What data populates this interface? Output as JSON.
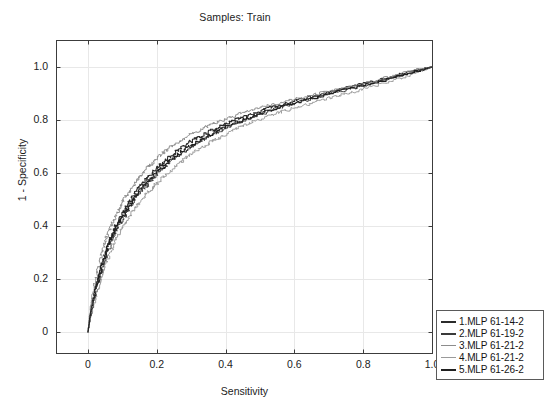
{
  "chart_data": {
    "type": "line",
    "title": "Samples: Train",
    "xlabel": "Sensitivity",
    "ylabel": "1 - Specificity",
    "xlim": [
      -0.04,
      1.04
    ],
    "ylim": [
      -0.04,
      1.04
    ],
    "grid": true,
    "legend_position": "outside-bottom-right",
    "xticks": [
      "0",
      "0.2",
      "0.4",
      "0.6",
      "0.8",
      "1.0"
    ],
    "xtick_values": [
      0,
      0.2,
      0.4,
      0.6,
      0.8,
      1.0
    ],
    "yticks": [
      "0",
      "0.2",
      "0.4",
      "0.6",
      "0.8",
      "1.0"
    ],
    "ytick_values": [
      0,
      0.2,
      0.4,
      0.6,
      0.8,
      1.0
    ],
    "series": [
      {
        "name": "1.MLP 61-14-2",
        "color": "#2b2b2b",
        "x": [
          0,
          0.005,
          0.012,
          0.02,
          0.028,
          0.035,
          0.045,
          0.055,
          0.065,
          0.075,
          0.085,
          0.095,
          0.108,
          0.12,
          0.133,
          0.148,
          0.162,
          0.178,
          0.195,
          0.213,
          0.232,
          0.252,
          0.274,
          0.296,
          0.32,
          0.345,
          0.372,
          0.4,
          0.43,
          0.462,
          0.495,
          0.53,
          0.567,
          0.605,
          0.645,
          0.688,
          0.732,
          0.778,
          0.826,
          0.876,
          0.928,
          0.963,
          1.0
        ],
        "y": [
          0,
          0.055,
          0.108,
          0.152,
          0.196,
          0.232,
          0.278,
          0.318,
          0.352,
          0.385,
          0.412,
          0.438,
          0.468,
          0.492,
          0.518,
          0.544,
          0.565,
          0.588,
          0.612,
          0.634,
          0.655,
          0.676,
          0.698,
          0.716,
          0.734,
          0.752,
          0.77,
          0.786,
          0.802,
          0.817,
          0.832,
          0.846,
          0.86,
          0.874,
          0.888,
          0.902,
          0.916,
          0.93,
          0.945,
          0.962,
          0.98,
          0.991,
          1.0
        ]
      },
      {
        "name": "2.MLP 61-19-2",
        "color": "#3a3a3a",
        "x": [
          0,
          0.006,
          0.014,
          0.022,
          0.03,
          0.039,
          0.049,
          0.06,
          0.07,
          0.081,
          0.092,
          0.104,
          0.116,
          0.129,
          0.143,
          0.158,
          0.174,
          0.191,
          0.209,
          0.228,
          0.248,
          0.27,
          0.292,
          0.316,
          0.34,
          0.366,
          0.393,
          0.422,
          0.452,
          0.483,
          0.516,
          0.551,
          0.587,
          0.625,
          0.665,
          0.707,
          0.75,
          0.795,
          0.842,
          0.89,
          0.94,
          0.97,
          1.0
        ],
        "y": [
          0,
          0.048,
          0.1,
          0.145,
          0.188,
          0.228,
          0.272,
          0.312,
          0.346,
          0.378,
          0.406,
          0.432,
          0.46,
          0.486,
          0.512,
          0.536,
          0.558,
          0.582,
          0.606,
          0.628,
          0.65,
          0.671,
          0.692,
          0.712,
          0.73,
          0.748,
          0.766,
          0.783,
          0.799,
          0.814,
          0.829,
          0.844,
          0.858,
          0.872,
          0.886,
          0.9,
          0.914,
          0.929,
          0.944,
          0.961,
          0.979,
          0.99,
          1.0
        ]
      },
      {
        "name": "3.MLP 61-21-2",
        "color": "#8c8c8c",
        "x": [
          0,
          0.004,
          0.01,
          0.017,
          0.024,
          0.031,
          0.04,
          0.049,
          0.058,
          0.068,
          0.078,
          0.088,
          0.1,
          0.112,
          0.125,
          0.139,
          0.154,
          0.17,
          0.187,
          0.205,
          0.224,
          0.245,
          0.267,
          0.29,
          0.314,
          0.34,
          0.367,
          0.396,
          0.426,
          0.458,
          0.492,
          0.528,
          0.565,
          0.604,
          0.645,
          0.688,
          0.733,
          0.78,
          0.828,
          0.878,
          0.93,
          0.965,
          1.0
        ],
        "y": [
          0,
          0.06,
          0.118,
          0.165,
          0.21,
          0.248,
          0.295,
          0.336,
          0.372,
          0.404,
          0.432,
          0.459,
          0.49,
          0.516,
          0.542,
          0.568,
          0.591,
          0.615,
          0.638,
          0.66,
          0.681,
          0.702,
          0.722,
          0.74,
          0.757,
          0.773,
          0.789,
          0.803,
          0.817,
          0.83,
          0.843,
          0.855,
          0.867,
          0.879,
          0.892,
          0.905,
          0.918,
          0.932,
          0.947,
          0.963,
          0.981,
          0.991,
          1.0
        ]
      },
      {
        "name": "4.MLP 61-21-2",
        "color": "#9a9a9a",
        "x": [
          0,
          0.006,
          0.015,
          0.024,
          0.033,
          0.043,
          0.054,
          0.066,
          0.078,
          0.09,
          0.103,
          0.116,
          0.13,
          0.144,
          0.159,
          0.175,
          0.192,
          0.21,
          0.229,
          0.249,
          0.27,
          0.292,
          0.315,
          0.34,
          0.365,
          0.392,
          0.42,
          0.449,
          0.48,
          0.512,
          0.545,
          0.58,
          0.616,
          0.654,
          0.693,
          0.734,
          0.776,
          0.82,
          0.865,
          0.91,
          0.952,
          0.977,
          1.0
        ],
        "y": [
          0,
          0.044,
          0.094,
          0.14,
          0.182,
          0.222,
          0.265,
          0.305,
          0.34,
          0.371,
          0.4,
          0.427,
          0.454,
          0.479,
          0.504,
          0.528,
          0.551,
          0.574,
          0.597,
          0.62,
          0.642,
          0.663,
          0.684,
          0.704,
          0.723,
          0.742,
          0.76,
          0.777,
          0.793,
          0.809,
          0.824,
          0.838,
          0.852,
          0.866,
          0.88,
          0.894,
          0.909,
          0.924,
          0.94,
          0.958,
          0.977,
          0.989,
          1.0
        ]
      },
      {
        "name": "5.MLP 61-26-2",
        "color": "#202020",
        "x": [
          0,
          0.005,
          0.013,
          0.021,
          0.029,
          0.037,
          0.047,
          0.057,
          0.067,
          0.078,
          0.089,
          0.1,
          0.113,
          0.126,
          0.14,
          0.155,
          0.17,
          0.187,
          0.205,
          0.224,
          0.244,
          0.265,
          0.288,
          0.311,
          0.336,
          0.362,
          0.39,
          0.419,
          0.449,
          0.481,
          0.514,
          0.549,
          0.586,
          0.624,
          0.664,
          0.706,
          0.75,
          0.795,
          0.842,
          0.891,
          0.942,
          0.971,
          1.0
        ],
        "y": [
          0,
          0.052,
          0.105,
          0.15,
          0.193,
          0.231,
          0.276,
          0.316,
          0.35,
          0.382,
          0.41,
          0.436,
          0.465,
          0.49,
          0.516,
          0.541,
          0.563,
          0.586,
          0.61,
          0.632,
          0.653,
          0.674,
          0.695,
          0.714,
          0.732,
          0.75,
          0.768,
          0.784,
          0.8,
          0.815,
          0.83,
          0.845,
          0.859,
          0.873,
          0.887,
          0.901,
          0.915,
          0.93,
          0.945,
          0.962,
          0.98,
          0.99,
          1.0
        ]
      }
    ]
  },
  "legend": {
    "items": [
      {
        "label": "1.MLP 61-14-2",
        "color": "#2b2b2b"
      },
      {
        "label": "2.MLP 61-19-2",
        "color": "#3a3a3a"
      },
      {
        "label": "3.MLP 61-21-2",
        "color": "#8c8c8c"
      },
      {
        "label": "4.MLP 61-21-2",
        "color": "#9a9a9a"
      },
      {
        "label": "5.MLP 61-26-2",
        "color": "#202020"
      }
    ]
  },
  "style": {
    "axis_color": "#3c3c3c",
    "grid_color": "#e8e8e8",
    "text_color": "#1c1c1c",
    "background": "#ffffff"
  }
}
